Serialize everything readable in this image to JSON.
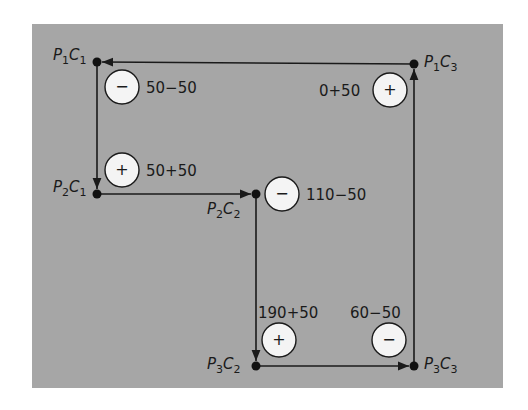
{
  "diagram": {
    "background": "#a6a6a6",
    "line_color": "#1a1a1a",
    "circle_fill": "#f4f4f4",
    "nodes": [
      {
        "id": "P1C1",
        "p": "1",
        "c": "1",
        "x": 97,
        "y": 62
      },
      {
        "id": "P2C1",
        "p": "2",
        "c": "1",
        "x": 97,
        "y": 194
      },
      {
        "id": "P2C2",
        "p": "2",
        "c": "2",
        "x": 256,
        "y": 194
      },
      {
        "id": "P3C2",
        "p": "3",
        "c": "2",
        "x": 256,
        "y": 366
      },
      {
        "id": "P3C3",
        "p": "3",
        "c": "3",
        "x": 414,
        "y": 366
      },
      {
        "id": "P1C3",
        "p": "1",
        "c": "3",
        "x": 414,
        "y": 64
      }
    ],
    "edges": [
      {
        "from": "P1C3",
        "to": "P1C1"
      },
      {
        "from": "P1C1",
        "to": "P2C1"
      },
      {
        "from": "P2C1",
        "to": "P2C2"
      },
      {
        "from": "P2C2",
        "to": "P3C2"
      },
      {
        "from": "P3C2",
        "to": "P3C3"
      },
      {
        "from": "P3C3",
        "to": "P1C3"
      }
    ],
    "markers": [
      {
        "cell": "P1C1",
        "sign": "−",
        "value": "50−50"
      },
      {
        "cell": "P2C1",
        "sign": "+",
        "value": "50+50"
      },
      {
        "cell": "P2C2",
        "sign": "−",
        "value": "110−50"
      },
      {
        "cell": "P3C2",
        "sign": "+",
        "value": "190+50"
      },
      {
        "cell": "P3C3",
        "sign": "−",
        "value": "60−50"
      },
      {
        "cell": "P1C3",
        "sign": "+",
        "value": "0+50"
      }
    ]
  }
}
